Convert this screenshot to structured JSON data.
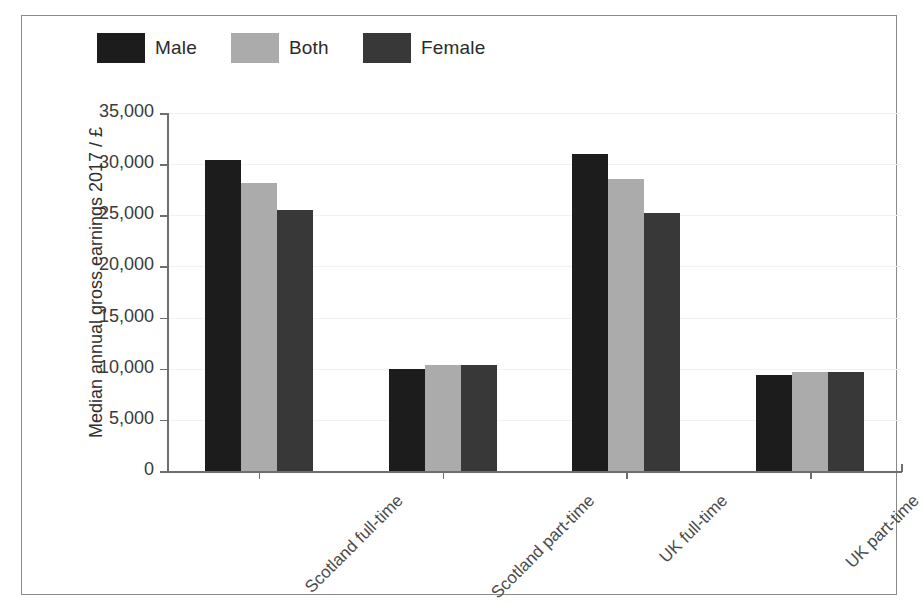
{
  "chart_data": {
    "type": "bar",
    "title": "",
    "xlabel": "",
    "ylabel": "Median annual gross earnings 2017 / £",
    "ylim": [
      0,
      35000
    ],
    "ytick_labels": [
      "0",
      "5,000",
      "10,000",
      "15,000",
      "20,000",
      "25,000",
      "30,000",
      "35,000"
    ],
    "ytick_values": [
      0,
      5000,
      10000,
      15000,
      20000,
      25000,
      30000,
      35000
    ],
    "grid": true,
    "legend_position": "top-left",
    "categories": [
      "Scotland full-time",
      "Scotland part-time",
      "UK full-time",
      "UK part-time"
    ],
    "series": [
      {
        "name": "Male",
        "color": "#1c1c1c",
        "values": [
          30400,
          9980,
          31000,
          9400
        ]
      },
      {
        "name": "Both",
        "color": "#ababab",
        "values": [
          28200,
          10400,
          28550,
          9650
        ]
      },
      {
        "name": "Female",
        "color": "#383838",
        "values": [
          25500,
          10400,
          25200,
          9650
        ]
      }
    ]
  },
  "figure": {
    "frame_color": "#8a8a8a",
    "axis_color": "#6e6e6e",
    "background": "#ffffff"
  }
}
